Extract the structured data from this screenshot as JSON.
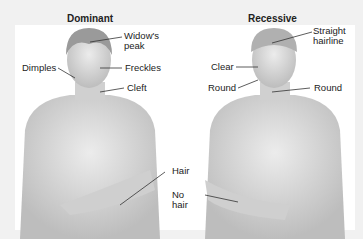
{
  "figure": {
    "panels": [
      {
        "title": "Dominant",
        "labels": {
          "hairline": "Widow's",
          "hairline2": "peak",
          "cheek": "Dimples",
          "skin": "Freckles",
          "chin": "Cleft",
          "arm": "Hair"
        }
      },
      {
        "title": "Recessive",
        "labels": {
          "hairline": "Straight",
          "hairline2": "hairline",
          "skin": "Clear",
          "cheek": "Round",
          "chin": "Round",
          "arm": "No",
          "arm2": "hair"
        }
      }
    ],
    "colors": {
      "background": "#f1f1f1",
      "panel": "#ffffff",
      "skin": "#d9d9d9",
      "hair": "#9a9a9a",
      "text": "#222222"
    }
  }
}
